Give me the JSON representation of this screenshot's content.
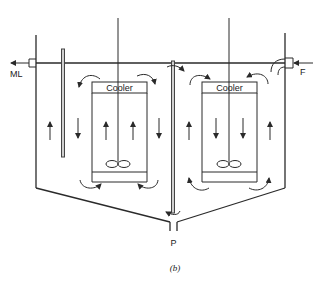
{
  "figure": {
    "caption": "(b)",
    "labels": {
      "outlet_left": "ML",
      "feed_right": "F",
      "product_bottom": "P"
    },
    "units": [
      {
        "id": "left",
        "cooler_label": "Cooler"
      },
      {
        "id": "right",
        "cooler_label": "Cooler"
      }
    ],
    "colors": {
      "line": "#2a2a2a",
      "baffle_fill": "#cfcfcf",
      "background": "#ffffff"
    }
  }
}
